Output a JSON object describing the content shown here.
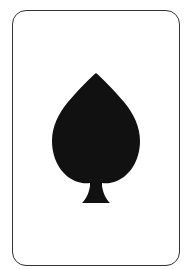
{
  "card": {
    "suit": "spades",
    "suit_icon": "spade-icon",
    "rank_label": "",
    "face": "up",
    "border_color": "#333333",
    "background_color": "#ffffff",
    "pip_color": "#111111",
    "pip_count": 1
  }
}
